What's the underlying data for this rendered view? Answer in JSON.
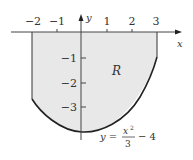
{
  "figure": {
    "region_label": "R",
    "axis_x_label": "x",
    "axis_y_label": "y",
    "x_ticks": [
      {
        "value": -2,
        "label": "−2"
      },
      {
        "value": -1,
        "label": "−1"
      },
      {
        "value": 1,
        "label": "1"
      },
      {
        "value": 2,
        "label": "2"
      },
      {
        "value": 3,
        "label": "3"
      }
    ],
    "y_ticks": [
      {
        "value": -1,
        "label": "−1"
      },
      {
        "value": -2,
        "label": "−2"
      },
      {
        "value": -3,
        "label": "−3"
      }
    ],
    "equation": {
      "lhs": "y =",
      "numerator": "x",
      "exponent": "2",
      "denominator": "3",
      "rest": "− 4"
    },
    "curve": "y = x^2/3 - 4",
    "region_bounds": {
      "x_min": -2,
      "x_max": 3,
      "top": "y = 0",
      "bottom": "y = x^2/3 - 4"
    },
    "colors": {
      "shade": "#e8e8e8",
      "curve": "#222222",
      "axis": "#444444"
    }
  }
}
